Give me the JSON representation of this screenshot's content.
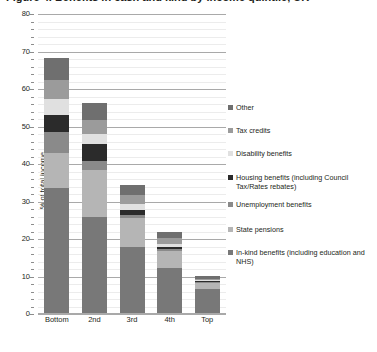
{
  "title": "Figure 4. Benefits in cash and kind by income quintile, UK",
  "axis": {
    "ylabel": "% of total income",
    "yticks": [
      "0",
      "10",
      "20",
      "30",
      "40",
      "50",
      "60",
      "70",
      "80"
    ]
  },
  "legend": {
    "items": [
      {
        "label": "Other",
        "color": "#6f6f6f"
      },
      {
        "label": "Tax credits",
        "color": "#9b9b9b"
      },
      {
        "label": "Disability benefits",
        "color": "#e0e0e0"
      },
      {
        "label": "Housing benefits (including Council Tax/Rates rebates)",
        "color": "#2b2b2b"
      },
      {
        "label": "Unemployment benefits",
        "color": "#8a8a8a"
      },
      {
        "label": "State pensions",
        "color": "#b5b5b5"
      },
      {
        "label": "In-kind benefits (including education and NHS)",
        "color": "#787878"
      }
    ]
  },
  "chart_data": {
    "type": "bar",
    "stacked": true,
    "title": "Figure 4. Benefits in cash and kind by income quintile, UK",
    "xlabel": "",
    "ylabel": "% of total income",
    "ylim": [
      0,
      80
    ],
    "ytick_step": 10,
    "minor_grid_step": 2,
    "grid": true,
    "legend_position": "right",
    "categories": [
      "Bottom",
      "2nd",
      "3rd",
      "4th",
      "Top"
    ],
    "series": [
      {
        "name": "In-kind benefits (including education and NHS)",
        "color": "#787878",
        "values": [
          33.5,
          26.0,
          18.0,
          12.3,
          6.7
        ]
      },
      {
        "name": "State pensions",
        "color": "#b5b5b5",
        "values": [
          9.5,
          12.5,
          7.7,
          4.6,
          1.6
        ]
      },
      {
        "name": "Unemployment benefits",
        "color": "#8a8a8a",
        "values": [
          5.5,
          2.3,
          0.8,
          0.4,
          0.2
        ]
      },
      {
        "name": "Housing benefits (including Council Tax/Rates rebates)",
        "color": "#2b2b2b",
        "values": [
          4.5,
          4.5,
          1.3,
          0.6,
          0.2
        ]
      },
      {
        "name": "Disability benefits",
        "color": "#e0e0e0",
        "values": [
          4.3,
          2.8,
          1.5,
          0.9,
          0.3
        ]
      },
      {
        "name": "Tax credits",
        "color": "#9b9b9b",
        "values": [
          5.0,
          3.7,
          2.5,
          1.4,
          0.4
        ]
      },
      {
        "name": "Other",
        "color": "#6f6f6f",
        "values": [
          6.0,
          4.5,
          2.7,
          1.8,
          0.8
        ]
      }
    ],
    "totals": [
      68.3,
      56.3,
      34.5,
      22.0,
      10.2
    ]
  }
}
